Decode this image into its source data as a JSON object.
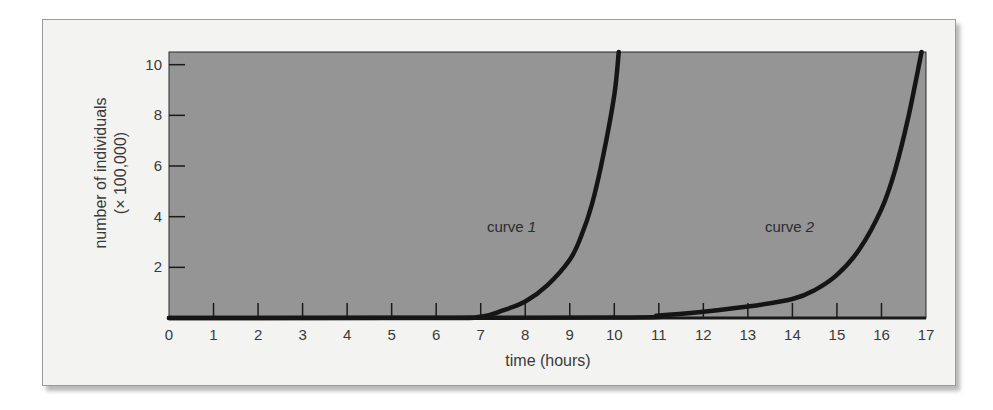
{
  "chart_data": {
    "type": "line",
    "title": "",
    "xlabel": "time (hours)",
    "ylabel": "number of individuals",
    "ylabel_units": "(× 100,000)",
    "xlim": [
      0,
      17
    ],
    "ylim": [
      0,
      10.5
    ],
    "x_ticks": [
      0,
      1,
      2,
      3,
      4,
      5,
      6,
      7,
      8,
      9,
      10,
      11,
      12,
      13,
      14,
      15,
      16,
      17
    ],
    "y_ticks": [
      2,
      4,
      6,
      8,
      10
    ],
    "grid": false,
    "legend": "inline labels",
    "plot_background": "#959595",
    "series": [
      {
        "name": "curve 1",
        "label_text": "curve ",
        "label_num": "1",
        "x": [
          0,
          6,
          7,
          7.5,
          8,
          8.5,
          9,
          9.25,
          9.5,
          9.75,
          10.0,
          10.1
        ],
        "y": [
          0,
          0,
          0.05,
          0.3,
          0.65,
          1.3,
          2.3,
          3.2,
          4.5,
          6.4,
          8.8,
          10.5
        ]
      },
      {
        "name": "curve 2",
        "label_text": "curve ",
        "label_num": "2",
        "x": [
          0,
          10,
          11,
          12,
          13,
          14,
          14.5,
          15,
          15.5,
          16,
          16.3,
          16.6,
          16.9
        ],
        "y": [
          0,
          0.02,
          0.1,
          0.25,
          0.45,
          0.75,
          1.1,
          1.7,
          2.7,
          4.3,
          5.8,
          7.9,
          10.5
        ]
      }
    ]
  }
}
